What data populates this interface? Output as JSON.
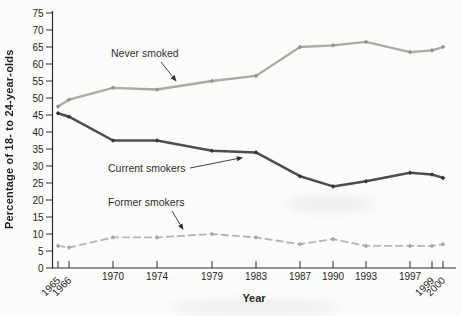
{
  "chart_data": {
    "type": "line",
    "title": "",
    "xlabel": "Year",
    "ylabel": "Percentage of 18- to 24-year-olds",
    "xlim": [
      1965,
      2000
    ],
    "ylim": [
      0,
      75
    ],
    "grid": "off",
    "legend": "none (direct line annotations with arrows)",
    "y_ticks": [
      0,
      5,
      10,
      15,
      20,
      25,
      30,
      35,
      40,
      45,
      50,
      55,
      60,
      65,
      70,
      75
    ],
    "x_ticks": [
      {
        "year": 1965,
        "label": "1965",
        "rotated": true
      },
      {
        "year": 1966,
        "label": "1966",
        "rotated": true
      },
      {
        "year": 1970,
        "label": "1970",
        "rotated": false
      },
      {
        "year": 1974,
        "label": "1974",
        "rotated": false
      },
      {
        "year": 1979,
        "label": "1979",
        "rotated": false
      },
      {
        "year": 1983,
        "label": "1983",
        "rotated": false
      },
      {
        "year": 1987,
        "label": "1987",
        "rotated": false
      },
      {
        "year": 1990,
        "label": "1990",
        "rotated": false
      },
      {
        "year": 1993,
        "label": "1993",
        "rotated": false
      },
      {
        "year": 1997,
        "label": "1997",
        "rotated": false
      },
      {
        "year": 1999,
        "label": "1999",
        "rotated": true
      },
      {
        "year": 2000,
        "label": "2000",
        "rotated": true
      }
    ],
    "x": [
      1965,
      1966,
      1970,
      1974,
      1979,
      1983,
      1987,
      1990,
      1993,
      1997,
      1999,
      2000
    ],
    "series": [
      {
        "name": "Never smoked",
        "line_style": "solid",
        "color": "#a7aca4",
        "marker_color": "#8f958d",
        "stroke_width": 2.3,
        "values": [
          47.5,
          49.5,
          53,
          52.5,
          55,
          56.5,
          65,
          65.5,
          66.5,
          63.5,
          64,
          65
        ]
      },
      {
        "name": "Current smokers",
        "line_style": "solid",
        "color": "#4d4d4d",
        "marker_color": "#383838",
        "stroke_width": 2.5,
        "values": [
          45.5,
          44.5,
          37.5,
          37.5,
          34.5,
          34,
          27,
          24,
          25.5,
          28,
          27.5,
          26.5
        ]
      },
      {
        "name": "Former smokers",
        "line_style": "dashed",
        "color": "#b6b6b6",
        "marker_color": "#a5a5a5",
        "stroke_width": 1.9,
        "dash": [
          6.5,
          4.5
        ],
        "values": [
          6.5,
          6,
          9,
          9,
          10,
          9,
          7,
          8.5,
          6.5,
          6.5,
          6.5,
          7
        ]
      }
    ],
    "annotations": [
      {
        "id": "never-smoked",
        "text": "Never smoked",
        "text_x": 111,
        "text_y": 57,
        "arrow": [
          161,
          62,
          176.5,
          81.5
        ]
      },
      {
        "id": "current-smokers",
        "text": "Current smokers",
        "text_x": 108,
        "text_y": 172,
        "arrow": [
          190,
          168,
          243,
          157.5
        ]
      },
      {
        "id": "former-smokers",
        "text": "Former smokers",
        "text_x": 108,
        "text_y": 206,
        "arrow": [
          172,
          211,
          183.5,
          230
        ]
      }
    ],
    "axis_color": "#2b2b2b"
  }
}
